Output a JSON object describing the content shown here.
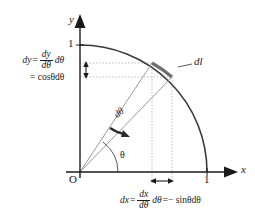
{
  "figure": {
    "axes": {
      "x_label": "x",
      "y_label": "y",
      "x_tick_label": "1",
      "y_tick_label": "1",
      "origin_label": "O"
    },
    "angles": {
      "theta_label": "θ",
      "dtheta_label": "dθ"
    },
    "arc_segment_label": "dl",
    "equations": {
      "dy": {
        "lhs": "dy",
        "equals": "=",
        "frac_numerator": "dy",
        "frac_denominator": "dθ",
        "frac_suffix": "dθ",
        "second_line": "= cosθdθ"
      },
      "dx": {
        "lhs": "dx",
        "equals": "=",
        "frac_numerator": "dx",
        "frac_denominator": "dθ",
        "frac_suffix": "dθ",
        "tail": "=− sinθdθ"
      }
    },
    "colors": {
      "stroke": "#1a1a1a",
      "arc": "#3d3d3d",
      "radius": "#8a8a8a",
      "guide": "#b8b8b8",
      "highlight": "#6e6e6e",
      "background": "#ffffff"
    }
  }
}
